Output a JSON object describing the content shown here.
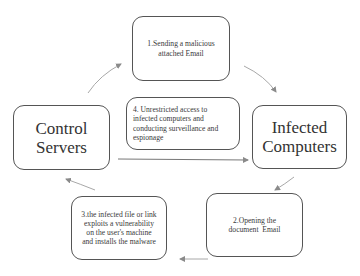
{
  "diagram": {
    "nodes": [
      {
        "id": "step1",
        "label": "1.Sending a malicious attached Email"
      },
      {
        "id": "control",
        "label": "Control Servers",
        "lines": [
          "Control",
          "Servers"
        ]
      },
      {
        "id": "step4",
        "label": "4. Unrestricted access to infected computers and conducting surveillance and espionage"
      },
      {
        "id": "infected",
        "label": "Infected Computers",
        "lines": [
          "Infected",
          "Computers"
        ]
      },
      {
        "id": "step3",
        "label": "3.the infected file or link exploits a vulnerability on the user's machine and installs the malware"
      },
      {
        "id": "step2",
        "label": "2.Opening the document  Email"
      }
    ],
    "edges": [
      {
        "from": "control",
        "to": "step1"
      },
      {
        "from": "step1",
        "to": "infected"
      },
      {
        "from": "infected",
        "to": "step2"
      },
      {
        "from": "step2",
        "to": "step3"
      },
      {
        "from": "step3",
        "to": "control"
      },
      {
        "from": "control",
        "to": "infected",
        "via": "step4"
      }
    ],
    "colors": {
      "stroke": "#555555",
      "arrow": "#999999",
      "text": "#333333"
    }
  }
}
